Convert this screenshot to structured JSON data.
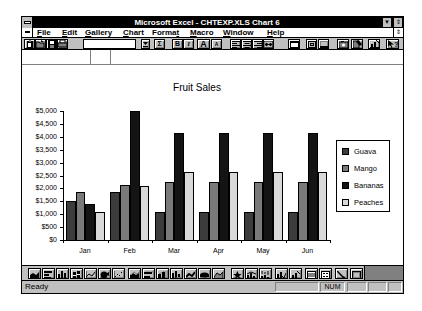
{
  "window": {
    "title": "Microsoft Excel - CHTEXP.XLS Chart 6",
    "minimize_glyph": "▼",
    "restore_glyph": "⇕"
  },
  "menu": {
    "items": [
      {
        "pre": "",
        "key": "F",
        "post": "ile"
      },
      {
        "pre": "",
        "key": "E",
        "post": "dit"
      },
      {
        "pre": "",
        "key": "G",
        "post": "allery"
      },
      {
        "pre": "",
        "key": "C",
        "post": "hart"
      },
      {
        "pre": "Forma",
        "key": "t",
        "post": ""
      },
      {
        "pre": "",
        "key": "M",
        "post": "acro"
      },
      {
        "pre": "",
        "key": "W",
        "post": "indow"
      },
      {
        "pre": "",
        "key": "H",
        "post": "elp"
      }
    ],
    "restore_glyph": "⇕"
  },
  "toolbar": {
    "style_box_value": "",
    "autosum_glyph": "Σ",
    "bold_glyph": "B",
    "italic_glyph": "I",
    "increase_font_glyph": "A",
    "decrease_font_glyph": "A",
    "help_glyph": "?",
    "buttons": [
      "clipboard-icon",
      "folder-open-icon",
      "save-disk-icon",
      "printer-icon",
      "style-combo",
      "dropdown-arrow-icon",
      "autosum-icon",
      "bold-icon",
      "italic-icon",
      "increase-font-icon",
      "decrease-font-icon",
      "align-left-icon",
      "align-center-icon",
      "align-right-icon",
      "center-across-icon",
      "autoformat-icon",
      "outline-border-icon",
      "bottom-border-icon",
      "copy-picture-icon",
      "paste-formats-icon",
      "chartwizard-icon",
      "help-pointer-icon"
    ]
  },
  "formula_bar": {
    "name_box": "",
    "content": ""
  },
  "chart_toolbar": {
    "buttons": [
      "area-chart-icon",
      "bar-chart-icon",
      "column-chart-icon",
      "stacked-column-chart-icon",
      "line-chart-icon",
      "pie-chart-icon",
      "scatter-chart-icon",
      "area-3d-chart-icon",
      "bar-3d-chart-icon",
      "column-3d-chart-icon",
      "perspective-column-3d-chart-icon",
      "line-3d-chart-icon",
      "pie-3d-chart-icon",
      "surface-3d-chart-icon",
      "radar-chart-icon",
      "line-column-combo-icon",
      "volume-hlc-combo-icon",
      "preferred-chart-icon",
      "chartwizard-icon",
      "gridlines-icon",
      "legend-icon",
      "arrow-icon",
      "text-box-icon"
    ]
  },
  "status_bar": {
    "text": "Ready",
    "num_indicator": "NUM"
  },
  "chart_data": {
    "type": "bar",
    "title": "Fruit Sales",
    "xlabel": "",
    "ylabel": "",
    "categories": [
      "Jan",
      "Feb",
      "Mar",
      "Apr",
      "May",
      "Jun"
    ],
    "series": [
      {
        "name": "Guava",
        "color": "#3c3c3c",
        "values": [
          1500,
          1850,
          1100,
          1100,
          1100,
          1100
        ]
      },
      {
        "name": "Mango",
        "color": "#7a7a7a",
        "values": [
          1850,
          2150,
          2250,
          2250,
          2250,
          2250
        ]
      },
      {
        "name": "Bananas",
        "color": "#141414",
        "values": [
          1400,
          5000,
          4150,
          4150,
          4150,
          4150
        ]
      },
      {
        "name": "Peaches",
        "color": "#d9d9d9",
        "values": [
          1100,
          2100,
          2650,
          2650,
          2650,
          2650
        ]
      }
    ],
    "ylim": [
      0,
      5000
    ],
    "ytick_values": [
      0,
      500,
      1000,
      1500,
      2000,
      2500,
      3000,
      3500,
      4000,
      4500,
      5000
    ],
    "ytick_labels": [
      "$0",
      "$500",
      "$1,000",
      "$1,500",
      "$2,000",
      "$2,500",
      "$3,000",
      "$3,500",
      "$4,000",
      "$4,500",
      "$5,000"
    ],
    "grid": false,
    "legend_position": "right"
  }
}
